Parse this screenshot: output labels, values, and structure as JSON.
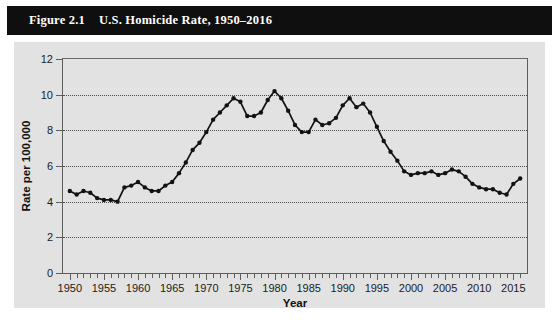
{
  "figure": {
    "number": "Figure 2.1",
    "caption": "U.S. Homicide Rate, 1950–2016",
    "title_bar_color": "#100f0f",
    "panel_color": "#e2e2e2"
  },
  "chart_data": {
    "type": "line",
    "title": "U.S. Homicide Rate, 1950–2016",
    "xlabel": "Year",
    "ylabel": "Rate per 100,000",
    "xlim": [
      1949,
      2017
    ],
    "ylim": [
      0,
      12
    ],
    "ytick_values": [
      0,
      2,
      4,
      6,
      8,
      10,
      12
    ],
    "ytick_labels": [
      "0",
      "2",
      "4",
      "6",
      "8",
      "10",
      "12"
    ],
    "xtick_values": [
      1950,
      1955,
      1960,
      1965,
      1970,
      1975,
      1980,
      1985,
      1990,
      1995,
      2000,
      2005,
      2010,
      2015
    ],
    "xtick_labels": [
      "1950",
      "1955",
      "1960",
      "1965",
      "1970",
      "1975",
      "1980",
      "1985",
      "1990",
      "1995",
      "2000",
      "2005",
      "2010",
      "2015"
    ],
    "minor_xticks_every": 1,
    "grid": "horizontal-dotted",
    "legend": "none",
    "marker": "filled-circle",
    "line_color": "#121212",
    "marker_color": "#121212",
    "x": [
      1950,
      1951,
      1952,
      1953,
      1954,
      1955,
      1956,
      1957,
      1958,
      1959,
      1960,
      1961,
      1962,
      1963,
      1964,
      1965,
      1966,
      1967,
      1968,
      1969,
      1970,
      1971,
      1972,
      1973,
      1974,
      1975,
      1976,
      1977,
      1978,
      1979,
      1980,
      1981,
      1982,
      1983,
      1984,
      1985,
      1986,
      1987,
      1988,
      1989,
      1990,
      1991,
      1992,
      1993,
      1994,
      1995,
      1996,
      1997,
      1998,
      1999,
      2000,
      2001,
      2002,
      2003,
      2004,
      2005,
      2006,
      2007,
      2008,
      2009,
      2010,
      2011,
      2012,
      2013,
      2014,
      2015,
      2016
    ],
    "y": [
      4.6,
      4.4,
      4.6,
      4.5,
      4.2,
      4.1,
      4.1,
      4.0,
      4.8,
      4.9,
      5.1,
      4.8,
      4.6,
      4.6,
      4.9,
      5.1,
      5.6,
      6.2,
      6.9,
      7.3,
      7.9,
      8.6,
      9.0,
      9.4,
      9.8,
      9.6,
      8.8,
      8.8,
      9.0,
      9.7,
      10.2,
      9.8,
      9.1,
      8.3,
      7.9,
      7.9,
      8.6,
      8.3,
      8.4,
      8.7,
      9.4,
      9.8,
      9.3,
      9.5,
      9.0,
      8.2,
      7.4,
      6.8,
      6.3,
      5.7,
      5.5,
      5.6,
      5.6,
      5.7,
      5.5,
      5.6,
      5.8,
      5.7,
      5.4,
      5.0,
      4.8,
      4.7,
      4.7,
      4.5,
      4.4,
      5.0,
      5.3
    ],
    "series_name": "U.S. Homicide Rate"
  }
}
